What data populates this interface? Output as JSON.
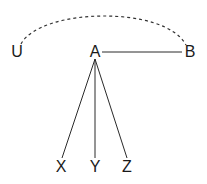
{
  "diagram": {
    "type": "graph",
    "nodes": [
      {
        "id": "U",
        "label": "U",
        "x": 17,
        "y": 57
      },
      {
        "id": "A",
        "label": "A",
        "x": 95,
        "y": 57
      },
      {
        "id": "B",
        "label": "B",
        "x": 189,
        "y": 57
      },
      {
        "id": "X",
        "label": "X",
        "x": 61,
        "y": 172
      },
      {
        "id": "Y",
        "label": "Y",
        "x": 95,
        "y": 172
      },
      {
        "id": "Z",
        "label": "Z",
        "x": 127,
        "y": 172
      }
    ],
    "edges": [
      {
        "from": "A",
        "to": "B",
        "style": "solid"
      },
      {
        "from": "A",
        "to": "X",
        "style": "solid"
      },
      {
        "from": "A",
        "to": "Y",
        "style": "solid"
      },
      {
        "from": "A",
        "to": "Z",
        "style": "solid"
      },
      {
        "from": "U",
        "to": "B",
        "style": "dashed-arc"
      }
    ],
    "colors": {
      "line": "#2a2a2a",
      "text": "#1a1a1a",
      "background": "#ffffff"
    }
  }
}
